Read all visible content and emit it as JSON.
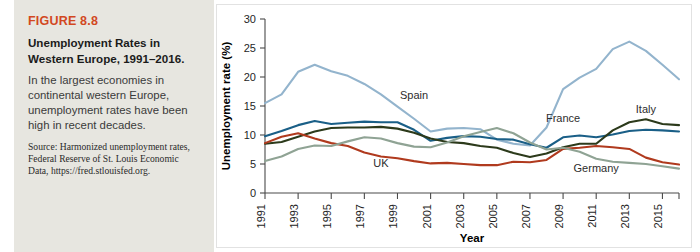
{
  "caption": {
    "figure_number": "FIGURE 8.8",
    "title": "Unemployment Rates in Western Europe, 1991–2016.",
    "description": "In the largest economies in continental western Europe, unemployment rates have been high in recent decades.",
    "source": "Source: Harmonized unemployment rates, Federal Reserve of St. Louis Economic Data, https://fred.stlouisfed.org."
  },
  "chart_data": {
    "type": "line",
    "title": "",
    "xlabel": "Year",
    "ylabel": "Unemployment rate (%)",
    "xlim": [
      1991,
      2016
    ],
    "ylim": [
      0,
      30
    ],
    "yticks": [
      0,
      5,
      10,
      15,
      20,
      25,
      30
    ],
    "xticks": [
      1991,
      1993,
      1995,
      1997,
      1999,
      2001,
      2003,
      2005,
      2007,
      2009,
      2011,
      2013,
      2015
    ],
    "xtick_labels": [
      "1991",
      "1993",
      "1995",
      "1997",
      "1999",
      "2001",
      "2003",
      "2005",
      "2007",
      "2009",
      "2011",
      "2013",
      "2015"
    ],
    "ytick_labels": [
      "0",
      "5",
      "10",
      "15",
      "20",
      "25",
      "30"
    ],
    "grid": false,
    "legend": "inline-labels",
    "x": [
      1991,
      1992,
      1993,
      1994,
      1995,
      1996,
      1997,
      1998,
      1999,
      2000,
      2001,
      2002,
      2003,
      2004,
      2005,
      2006,
      2007,
      2008,
      2009,
      2010,
      2011,
      2012,
      2013,
      2014,
      2015,
      2016
    ],
    "series": [
      {
        "name": "Spain",
        "color": "#93b4cd",
        "label_x": 2000,
        "label_y": 16.2,
        "values": [
          15.5,
          17.0,
          20.9,
          22.1,
          21.0,
          20.2,
          18.8,
          17.0,
          14.9,
          12.8,
          10.6,
          11.1,
          11.2,
          11.0,
          9.2,
          8.5,
          8.2,
          11.3,
          17.9,
          19.9,
          21.4,
          24.8,
          26.1,
          24.5,
          22.1,
          19.6
        ]
      },
      {
        "name": "France",
        "color": "#1a5f87",
        "label_x": 2009,
        "label_y": 12.3,
        "values": [
          9.8,
          10.7,
          11.7,
          12.4,
          11.9,
          12.1,
          12.3,
          12.2,
          12.2,
          10.9,
          9.0,
          9.5,
          9.8,
          9.7,
          9.3,
          9.2,
          8.4,
          7.8,
          9.6,
          9.9,
          9.6,
          10.1,
          10.7,
          10.9,
          10.8,
          10.6
        ]
      },
      {
        "name": "Italy",
        "color": "#2c3a1b",
        "label_x": 2014,
        "label_y": 13.8,
        "values": [
          8.5,
          8.8,
          9.7,
          10.6,
          11.2,
          11.3,
          11.3,
          11.4,
          11.1,
          10.4,
          9.4,
          8.8,
          8.6,
          8.1,
          7.8,
          6.9,
          6.2,
          6.8,
          7.9,
          8.5,
          8.5,
          10.8,
          12.2,
          12.7,
          11.9,
          11.7
        ]
      },
      {
        "name": "UK",
        "color": "#b03a1e",
        "label_x": 1998,
        "label_y": 4.4,
        "values": [
          8.6,
          9.7,
          10.3,
          9.4,
          8.6,
          8.1,
          7.0,
          6.3,
          6.0,
          5.5,
          5.1,
          5.2,
          5.0,
          4.8,
          4.8,
          5.4,
          5.3,
          5.7,
          7.6,
          7.8,
          8.1,
          7.9,
          7.6,
          6.1,
          5.3,
          4.9
        ]
      },
      {
        "name": "Germany",
        "color": "#8fa394",
        "label_x": 2011,
        "label_y": 3.6,
        "values": [
          5.5,
          6.3,
          7.6,
          8.2,
          8.1,
          8.9,
          9.6,
          9.4,
          8.6,
          8.0,
          7.9,
          8.7,
          9.8,
          10.5,
          11.2,
          10.3,
          8.7,
          7.5,
          7.8,
          7.1,
          5.9,
          5.4,
          5.2,
          5.0,
          4.6,
          4.2
        ]
      }
    ]
  }
}
